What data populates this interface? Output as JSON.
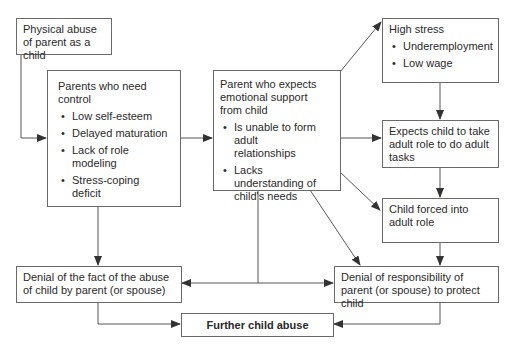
{
  "diagram": {
    "nodes": [
      {
        "id": "physical_abuse",
        "title": "Physical abuse of parent as a child",
        "bullets": []
      },
      {
        "id": "need_control",
        "title": "Parents who need control",
        "bullets": [
          "Low self-esteem",
          "Delayed maturation",
          "Lack of role modeling",
          "Stress-coping deficit"
        ]
      },
      {
        "id": "expects_support",
        "title": "Parent who expects emotional support from child",
        "bullets": [
          "Is unable to form adult relationships",
          "Lacks understanding of child's needs"
        ]
      },
      {
        "id": "high_stress",
        "title": "High stress",
        "bullets": [
          "Underemployment",
          "Low wage"
        ]
      },
      {
        "id": "expects_adult_role",
        "title": "Expects child to take adult role to do adult tasks",
        "bullets": []
      },
      {
        "id": "child_forced",
        "title": "Child forced into adult role",
        "bullets": []
      },
      {
        "id": "denial_fact",
        "title": "Denial of the fact of the abuse of child by parent (or spouse)",
        "bullets": []
      },
      {
        "id": "denial_responsibility",
        "title": "Denial of responsibility of parent (or spouse) to protect child",
        "bullets": []
      },
      {
        "id": "further_abuse",
        "title": "Further child abuse",
        "bullets": []
      }
    ],
    "edges": [
      {
        "from": "physical_abuse",
        "to": "need_control"
      },
      {
        "from": "need_control",
        "to": "expects_support"
      },
      {
        "from": "need_control",
        "to": "denial_fact"
      },
      {
        "from": "expects_support",
        "to": "high_stress"
      },
      {
        "from": "expects_support",
        "to": "expects_adult_role"
      },
      {
        "from": "expects_support",
        "to": "child_forced"
      },
      {
        "from": "expects_support",
        "to": "denial_responsibility"
      },
      {
        "from": "expects_support",
        "to": "denial_fact"
      },
      {
        "from": "expects_support",
        "to": "denial_responsibility"
      },
      {
        "from": "high_stress",
        "to": "expects_adult_role"
      },
      {
        "from": "expects_adult_role",
        "to": "child_forced"
      },
      {
        "from": "child_forced",
        "to": "denial_responsibility"
      },
      {
        "from": "denial_fact",
        "to": "further_abuse"
      },
      {
        "from": "denial_responsibility",
        "to": "further_abuse"
      }
    ]
  }
}
